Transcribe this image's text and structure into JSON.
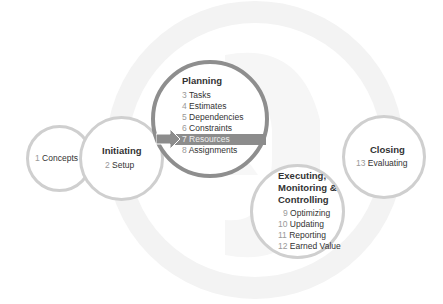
{
  "diagram": {
    "phases": [
      {
        "id": "concepts",
        "title": "",
        "items": [
          {
            "num": "1",
            "label": "Concepts"
          }
        ]
      },
      {
        "id": "initiating",
        "title": "Initiating",
        "items": [
          {
            "num": "2",
            "label": "Setup"
          }
        ]
      },
      {
        "id": "planning",
        "title": "Planning",
        "items": [
          {
            "num": "3",
            "label": "Tasks"
          },
          {
            "num": "4",
            "label": "Estimates"
          },
          {
            "num": "5",
            "label": "Dependencies"
          },
          {
            "num": "6",
            "label": "Constraints"
          },
          {
            "num": "7",
            "label": "Resources"
          },
          {
            "num": "8",
            "label": "Assignments"
          }
        ]
      },
      {
        "id": "executing",
        "title_lines": [
          "Executing,",
          "Monitoring &",
          "Controlling"
        ],
        "items": [
          {
            "num": "9",
            "label": "Optimizing"
          },
          {
            "num": "10",
            "label": "Updating"
          },
          {
            "num": "11",
            "label": "Reporting"
          },
          {
            "num": "12",
            "label": "Earned Value"
          }
        ]
      },
      {
        "id": "closing",
        "title": "Closing",
        "items": [
          {
            "num": "13",
            "label": "Evaluating"
          }
        ]
      }
    ],
    "highlighted_item": "7 Resources",
    "colors": {
      "highlight": "#8c8c8c",
      "circle_border": "#cfcfcf",
      "planning_border": "#8e8e8e",
      "number": "#999999",
      "text": "#333333"
    }
  }
}
